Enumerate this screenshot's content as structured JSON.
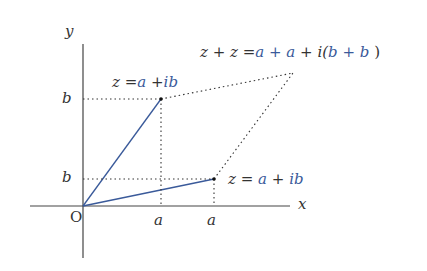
{
  "diagram": {
    "axes": {
      "x_label": "x",
      "y_label": "y",
      "origin_label": "O"
    },
    "tick_labels": {
      "b1": "b",
      "b2": "b",
      "a1": "a",
      "a2": "a"
    },
    "points": {
      "z1": {
        "lhs": "z",
        "eq": "=",
        "a": "a",
        "plus": "+",
        "ib": "ib"
      },
      "z2": {
        "lhs": "z",
        "eq": "=",
        "a": "a",
        "plus": "+",
        "ib": "ib"
      },
      "sum": {
        "lhs": "z + z",
        "eq": "=",
        "re": "a + a",
        "im_prefix": "+ i(",
        "im": "b + b",
        "close": ")"
      }
    },
    "colors": {
      "vector": "#3a5a9a",
      "axis": "#444444",
      "dotted": "#333333",
      "accent_text": "#3a5a9a"
    }
  }
}
